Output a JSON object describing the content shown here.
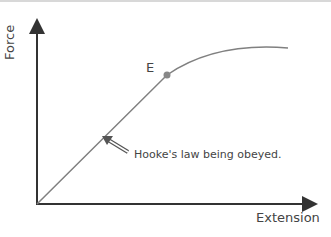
{
  "diagram": {
    "y_axis_label": "Force",
    "x_axis_label": "Extension",
    "point_label": "E",
    "annotation": "Hooke's law being obeyed.",
    "colors": {
      "axis": "#333333",
      "curve": "#808080",
      "point": "#888888",
      "text": "#444444"
    }
  }
}
